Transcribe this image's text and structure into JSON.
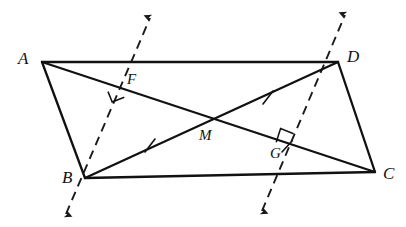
{
  "figure": {
    "shape_name": "parallelogram",
    "stroke_color": "#111111",
    "background_color": "#ffffff",
    "dash_color": "#222222",
    "canvas": {
      "width": 406,
      "height": 227
    }
  },
  "labels": {
    "A": "A",
    "B": "B",
    "C": "C",
    "D": "D",
    "M": "M",
    "F": "F",
    "G": "G"
  },
  "points": {
    "A": {
      "x": 42,
      "y": 62,
      "label": "A",
      "label_x": 18,
      "label_y": 52
    },
    "B": {
      "x": 85,
      "y": 178,
      "label": "B",
      "label_x": 62,
      "label_y": 172
    },
    "C": {
      "x": 375,
      "y": 172,
      "label": "C",
      "label_x": 383,
      "label_y": 168
    },
    "D": {
      "x": 338,
      "y": 62,
      "label": "D",
      "label_x": 347,
      "label_y": 50
    },
    "M": {
      "x": 208,
      "y": 122,
      "label": "M",
      "label_x": 200,
      "label_y": 131
    },
    "F": {
      "x": 120,
      "y": 88,
      "label": "F",
      "label_x": 127,
      "label_y": 74
    },
    "G": {
      "x": 288,
      "y": 148,
      "label": "G",
      "label_x": 272,
      "label_y": 150
    }
  },
  "solid_segments": [
    {
      "name": "side-AD",
      "from": "A",
      "to": "D"
    },
    {
      "name": "side-BC",
      "from": "B",
      "to": "C"
    },
    {
      "name": "side-AB",
      "from": "A",
      "to": "B"
    },
    {
      "name": "side-DC",
      "from": "D",
      "to": "C"
    },
    {
      "name": "diagonal-AC",
      "from": "A",
      "to": "C"
    },
    {
      "name": "diagonal-BD",
      "from": "B",
      "to": "D"
    }
  ],
  "dashed_lines": [
    {
      "name": "perpendicular-through-B",
      "through_points": [
        "B",
        "F"
      ],
      "x1": 66,
      "y1": 214,
      "x2": 150,
      "y2": 18,
      "arrow_start": true,
      "arrow_end": true
    },
    {
      "name": "perpendicular-through-D",
      "through_points": [
        "D",
        "G"
      ],
      "x1": 262,
      "y1": 211,
      "x2": 345,
      "y2": 15,
      "arrow_start": true,
      "arrow_end": true
    }
  ],
  "right_angle_marks": [
    {
      "name": "right-angle-at-F",
      "at": "F",
      "size": 13,
      "side": "below-left"
    },
    {
      "name": "right-angle-at-G",
      "at": "G",
      "size": 13,
      "side": "above-left"
    }
  ],
  "tick_marks": [
    {
      "name": "tick-BM",
      "on": "diagonal-BD",
      "x": 150,
      "y": 145,
      "count": 1
    },
    {
      "name": "tick-MD",
      "on": "diagonal-BD",
      "x": 268,
      "y": 97,
      "count": 1
    },
    {
      "name": "tick-BF",
      "on": "perpendicular-through-B",
      "x": 268,
      "y": 148,
      "count": 1
    }
  ]
}
